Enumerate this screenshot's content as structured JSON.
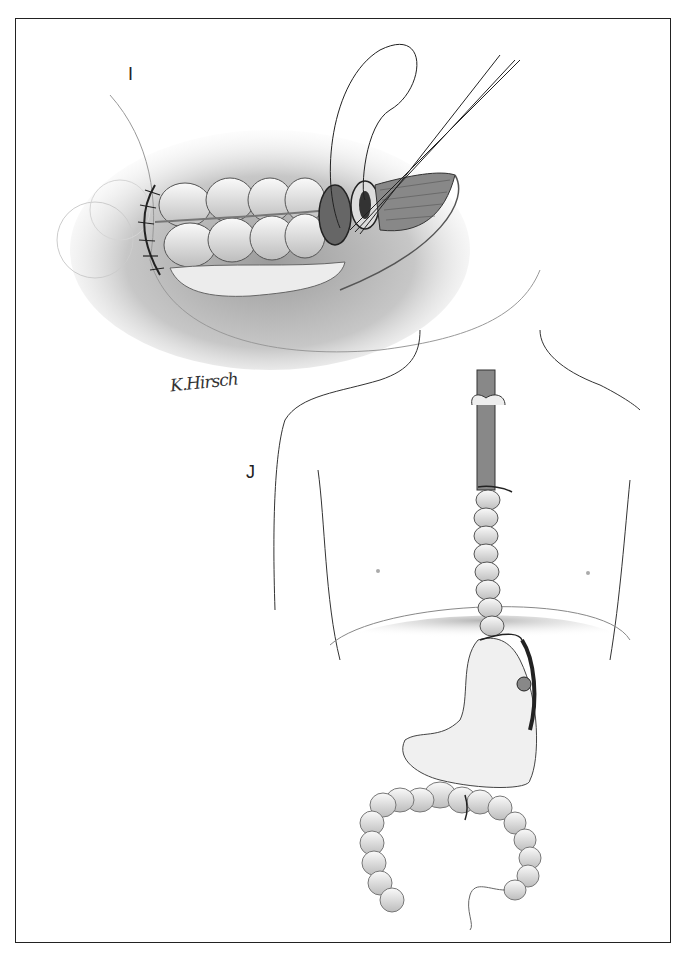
{
  "figure": {
    "panels": [
      {
        "label": "I",
        "description": "Colonic segment anastomosis with sutures inside abdominal incision"
      },
      {
        "label": "J",
        "description": "Torso outline showing colon interposition from esophagus to stomach with colocolic anastomosis"
      }
    ],
    "signature": "K.Hirsch",
    "colors": {
      "line": "#222222",
      "shade": "#9a9a9a",
      "light_shade": "#d8d8d8",
      "background": "#ffffff"
    }
  }
}
